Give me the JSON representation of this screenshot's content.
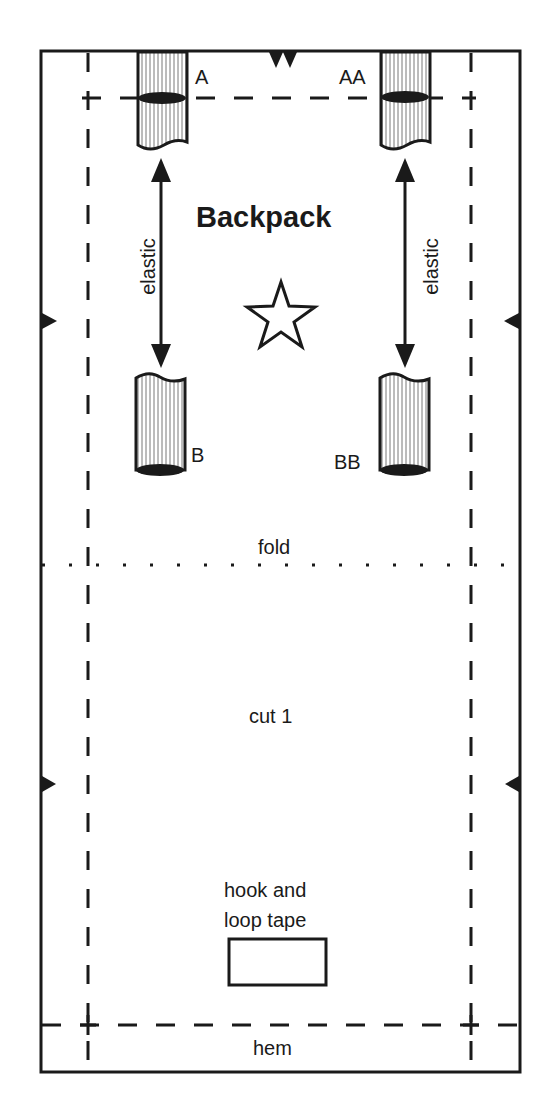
{
  "pattern": {
    "title": "Backpack",
    "labels": {
      "strap_top_left": "A",
      "strap_top_right": "AA",
      "strap_bottom_left": "B",
      "strap_bottom_right": "BB",
      "elastic_left": "elastic",
      "elastic_right": "elastic",
      "fold": "fold",
      "cut": "cut 1",
      "hook_loop_line1": "hook and",
      "hook_loop_line2": "loop tape",
      "hem": "hem"
    },
    "symbols": {
      "center": "star-icon",
      "top_notch": "double-notch-icon",
      "side_notches": "single-notch-icon"
    },
    "colors": {
      "line": "#1a1a1a",
      "background": "#ffffff"
    }
  }
}
